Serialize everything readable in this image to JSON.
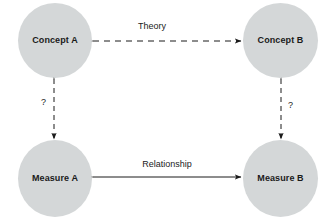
{
  "diagram": {
    "canvas": {
      "width": 332,
      "height": 220,
      "background": "#ffffff"
    },
    "node_fill": "#d4d7d8",
    "text_color": "#1a1a1a",
    "nodes": [
      {
        "id": "concept-a",
        "label": "Concept A"
      },
      {
        "id": "concept-b",
        "label": "Concept B"
      },
      {
        "id": "measure-a",
        "label": "Measure A"
      },
      {
        "id": "measure-b",
        "label": "Measure B"
      }
    ],
    "edges": [
      {
        "id": "theory",
        "label": "Theory",
        "from": "concept-a",
        "to": "concept-b",
        "style": "dashed",
        "arrowheads": "both"
      },
      {
        "id": "relationship",
        "label": "Relationship",
        "from": "measure-a",
        "to": "measure-b",
        "style": "solid",
        "arrowheads": "both"
      },
      {
        "id": "left-validity",
        "label": "?",
        "from": "concept-a",
        "to": "measure-a",
        "style": "dashed",
        "arrowheads": "both"
      },
      {
        "id": "right-validity",
        "label": "?",
        "from": "concept-b",
        "to": "measure-b",
        "style": "dashed",
        "arrowheads": "both"
      }
    ]
  }
}
